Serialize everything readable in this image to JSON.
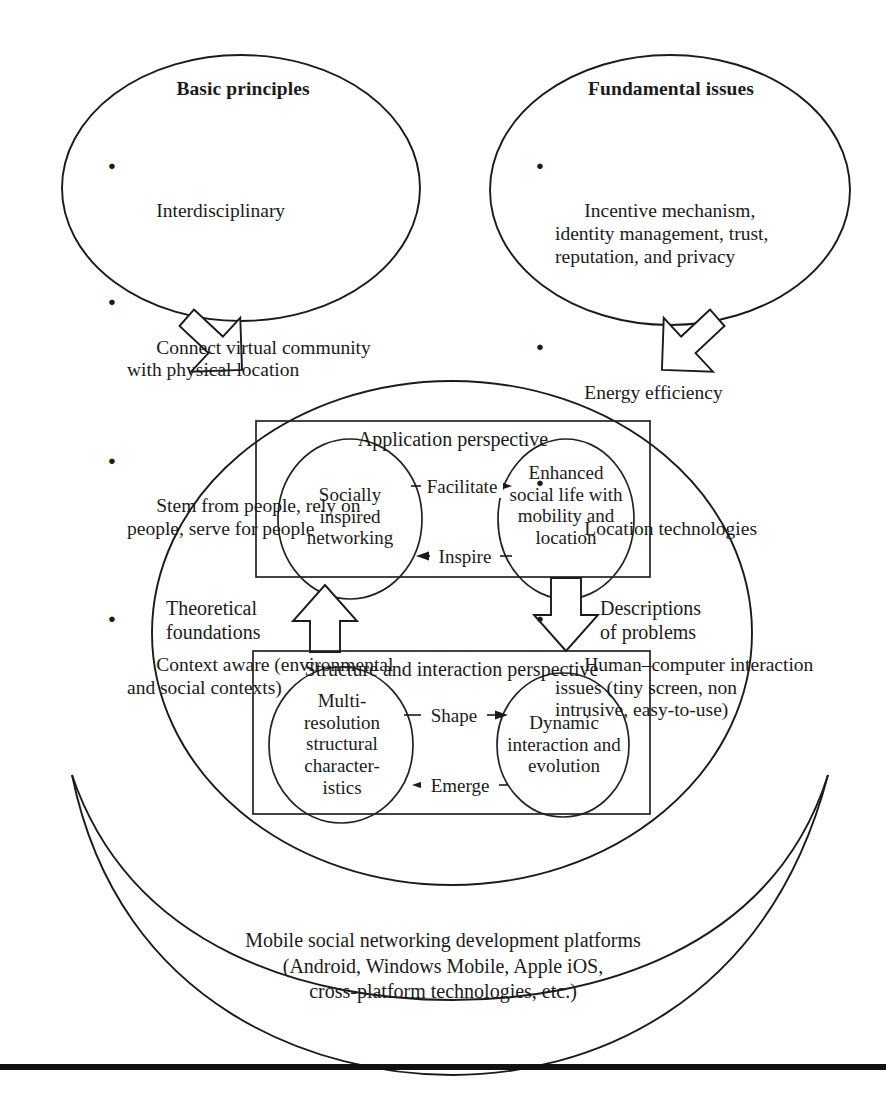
{
  "figure": {
    "left_ellipse": {
      "title": "Basic principles",
      "bullet_glyph": "●",
      "items": [
        "Interdisciplinary",
        "Connect virtual community\nwith physical location",
        "Stem from people, rely on\npeople, serve for people",
        "Context aware (environmental\nand social contexts)"
      ]
    },
    "right_ellipse": {
      "title": "Fundamental issues",
      "bullet_glyph": "●",
      "items": [
        "Incentive mechanism,\nidentity management, trust,\nreputation, and privacy",
        "Energy efficiency",
        "Location technologies",
        "Human–computer interaction\nissues (tiny screen, non\nintrusive, easy-to-use)"
      ]
    },
    "application_box": {
      "title": "Application perspective",
      "left_circle": "Socially\ninspired\nnetworking",
      "right_circle": "Enhanced\nsocial life with\nmobility and\nlocation",
      "edge_top": "Facilitate",
      "edge_bottom": "Inspire"
    },
    "structure_box": {
      "title": "Structure and interaction perspective",
      "left_circle": "Multi-\nresolution\nstructural\ncharacter-\nistics",
      "right_circle": "Dynamic\ninteraction and\nevolution",
      "edge_top": "Shape",
      "edge_bottom": "Emerge"
    },
    "vertical_links": {
      "up_label": "Theoretical\nfoundations",
      "down_label": "Descriptions\nof problems"
    },
    "platforms_band": {
      "text": "Mobile social networking development platforms\n(Android, Windows Mobile, Apple iOS,\ncross-platform technologies, etc.)"
    },
    "colors": {
      "ink": "#1b1b1b",
      "paper": "#ffffff",
      "rule": "#111111"
    }
  }
}
